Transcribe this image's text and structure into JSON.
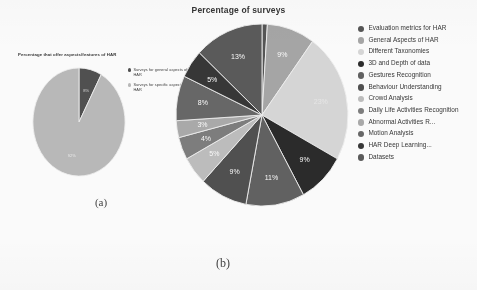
{
  "figure": {
    "main_title": "Percentage of surveys",
    "panel_a_caption": "(a)",
    "panel_b_caption": "(b)"
  },
  "panel_a": {
    "title": "Percentage that offer aspects/features of HAR",
    "legend": [
      {
        "label": "Surveys for general aspects of HAR",
        "color": "#4a4a4a"
      },
      {
        "label": "Surveys for specific aspects of HAR",
        "color": "#b9b9b9"
      }
    ]
  },
  "panel_b": {
    "legend": [
      {
        "label": "Evaluation metrics for HAR",
        "color": "#4f4f4f"
      },
      {
        "label": "General Aspects of HAR",
        "color": "#a5a5a5"
      },
      {
        "label": "Different Taxonomies",
        "color": "#d8d8d8"
      },
      {
        "label": "3D and Depth of data",
        "color": "#232323"
      },
      {
        "label": "Gestures Recognition",
        "color": "#5c5c5c"
      },
      {
        "label": "Behaviour Understanding",
        "color": "#4a4a4a"
      },
      {
        "label": "Crowd Analysis",
        "color": "#bdbdbd"
      },
      {
        "label": "Daily Life Activities Recognition",
        "color": "#7a7a7a"
      },
      {
        "label": "Abnormal Activities R...",
        "color": "#a9a9a9"
      },
      {
        "label": "Motion Analysis",
        "color": "#636363"
      },
      {
        "label": "HAR Deep Learning...",
        "color": "#2f2f2f"
      },
      {
        "label": "Datasets",
        "color": "#555555"
      }
    ]
  },
  "chart_data": [
    {
      "type": "pie",
      "id": "panel-a-pie",
      "title": "Percentage that offer aspects/features of HAR",
      "legend_position": "right",
      "categories": [
        "Surveys for general aspects of HAR",
        "Surveys for specific aspects of HAR"
      ],
      "values": [
        8,
        92
      ],
      "labels": [
        "8%",
        "92%"
      ],
      "colors": [
        "#4a4a4a",
        "#b9b9b9"
      ],
      "units": "percent"
    },
    {
      "type": "pie",
      "id": "panel-b-pie",
      "title": "Percentage of surveys",
      "legend_position": "right",
      "categories": [
        "Evaluation metrics for HAR",
        "General Aspects of HAR",
        "Different Taxonomies",
        "3D and Depth of data",
        "Gestures Recognition",
        "Behaviour Understanding",
        "Crowd Analysis",
        "Daily Life Activities Recognition",
        "Abnormal Activities R...",
        "Motion Analysis",
        "HAR Deep Learning...",
        "Datasets"
      ],
      "values": [
        1,
        9,
        23,
        9,
        11,
        9,
        5,
        4,
        3,
        8,
        5,
        13
      ],
      "labels": [
        "",
        "9%",
        "23%",
        "9%",
        "11%",
        "9%",
        "5%",
        "4%",
        "3%",
        "8%",
        "5%",
        "13%"
      ],
      "colors": [
        "#4f4f4f",
        "#a5a5a5",
        "#d8d8d8",
        "#232323",
        "#5c5c5c",
        "#4a4a4a",
        "#bdbdbd",
        "#7a7a7a",
        "#a9a9a9",
        "#636363",
        "#2f2f2f",
        "#555555"
      ],
      "units": "percent",
      "start_angle_deg": -90,
      "direction": "clockwise"
    }
  ]
}
